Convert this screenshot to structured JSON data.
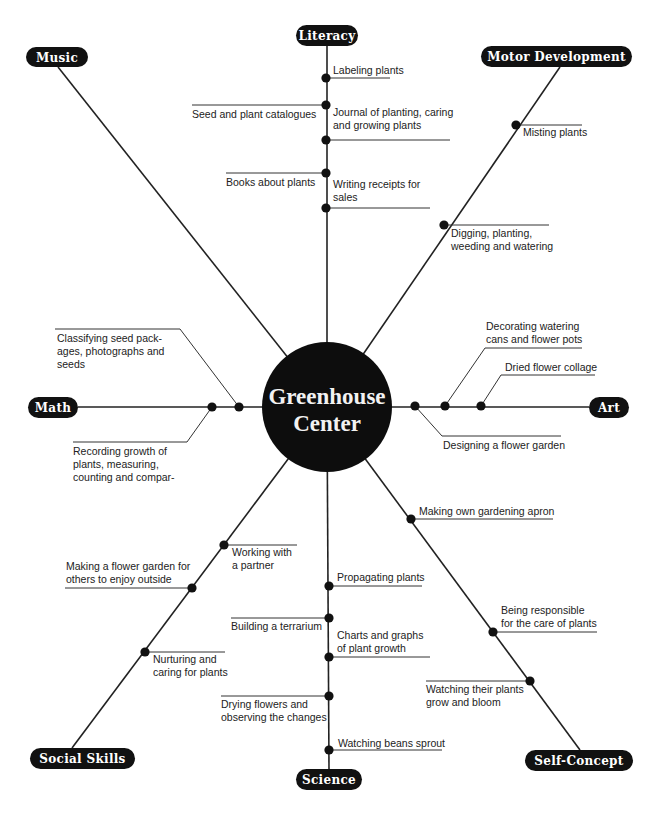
{
  "center": {
    "line1": "Greenhouse",
    "line2": "Center",
    "cx": 327,
    "cy": 407,
    "r": 65
  },
  "colors": {
    "ink": "#111111",
    "label_text": "#ffffff",
    "body_text": "#222222",
    "background": "#ffffff"
  },
  "categories": [
    {
      "id": "literacy",
      "label": "Literacy",
      "pill": {
        "x": 296,
        "y": 25,
        "w": 62,
        "h": 21
      },
      "end": [
        327,
        46
      ],
      "items": [
        {
          "lines": [
            "Labeling plants"
          ],
          "dot": [
            326,
            78
          ],
          "side": "right"
        },
        {
          "lines": [
            "Seed and plant catalogues"
          ],
          "dot": [
            326,
            105
          ],
          "side": "left"
        },
        {
          "lines": [
            "Journal of planting, caring",
            "and growing plants"
          ],
          "dot": [
            326,
            140
          ],
          "side": "right"
        },
        {
          "lines": [
            "Books about plants"
          ],
          "dot": [
            326,
            173
          ],
          "side": "left"
        },
        {
          "lines": [
            "Writing receipts for",
            "sales"
          ],
          "dot": [
            326,
            208
          ],
          "side": "right"
        }
      ]
    },
    {
      "id": "music",
      "label": "Music",
      "pill": {
        "x": 26,
        "y": 47,
        "w": 62,
        "h": 20
      },
      "end": [
        58,
        67
      ],
      "items": []
    },
    {
      "id": "motor",
      "label": "Motor Development",
      "pill": {
        "x": 481,
        "y": 46,
        "w": 151,
        "h": 21
      },
      "end": [
        560,
        67
      ],
      "items": [
        {
          "lines": [
            "Misting plants"
          ],
          "dot": [
            516,
            125
          ],
          "side": "right"
        },
        {
          "lines": [
            "Digging, planting,",
            "weeding and watering"
          ],
          "dot": [
            444,
            225
          ],
          "side": "right"
        }
      ]
    },
    {
      "id": "math",
      "label": "Math",
      "pill": {
        "x": 28,
        "y": 397,
        "w": 50,
        "h": 21
      },
      "end": [
        78,
        407
      ],
      "items": [
        {
          "lines": [
            "Classifying seed pack-",
            "ages, photographs and",
            "seeds"
          ],
          "dot": [
            239,
            407
          ],
          "side": "upper-left"
        },
        {
          "lines": [
            "Recording growth of",
            "plants, measuring,",
            "counting and compar-"
          ],
          "dot": [
            212,
            407
          ],
          "side": "lower-left"
        }
      ]
    },
    {
      "id": "art",
      "label": "Art",
      "pill": {
        "x": 589,
        "y": 397,
        "w": 40,
        "h": 21
      },
      "end": [
        589,
        407
      ],
      "items": [
        {
          "lines": [
            "Decorating watering",
            "cans and flower pots"
          ],
          "dot": [
            445,
            406
          ],
          "side": "upper-right"
        },
        {
          "lines": [
            "Dried flower collage"
          ],
          "dot": [
            481,
            406
          ],
          "side": "upper-right"
        },
        {
          "lines": [
            "Designing a flower garden"
          ],
          "dot": [
            415,
            406
          ],
          "side": "lower-right"
        }
      ]
    },
    {
      "id": "social",
      "label": "Social Skills",
      "pill": {
        "x": 30,
        "y": 748,
        "w": 105,
        "h": 21
      },
      "end": [
        72,
        748
      ],
      "items": [
        {
          "lines": [
            "Working with",
            "a partner"
          ],
          "dot": [
            224,
            545
          ],
          "side": "right"
        },
        {
          "lines": [
            "Making a flower garden for",
            "others to enjoy outside"
          ],
          "dot": [
            192,
            588
          ],
          "side": "left"
        },
        {
          "lines": [
            "Nurturing and",
            "caring for plants"
          ],
          "dot": [
            145,
            652
          ],
          "side": "right"
        }
      ]
    },
    {
      "id": "science",
      "label": "Science",
      "pill": {
        "x": 296,
        "y": 769,
        "w": 66,
        "h": 21
      },
      "end": [
        329,
        769
      ],
      "items": [
        {
          "lines": [
            "Propagating plants"
          ],
          "dot": [
            329,
            586
          ],
          "side": "right"
        },
        {
          "lines": [
            "Building a terrarium"
          ],
          "dot": [
            329,
            618
          ],
          "side": "left"
        },
        {
          "lines": [
            "Charts and graphs",
            "of plant growth"
          ],
          "dot": [
            329,
            657
          ],
          "side": "right"
        },
        {
          "lines": [
            "Drying flowers and",
            "observing the changes"
          ],
          "dot": [
            329,
            696
          ],
          "side": "left"
        },
        {
          "lines": [
            "Watching beans sprout"
          ],
          "dot": [
            329,
            750
          ],
          "side": "right"
        }
      ]
    },
    {
      "id": "self",
      "label": "Self-Concept",
      "pill": {
        "x": 525,
        "y": 750,
        "w": 108,
        "h": 21
      },
      "end": [
        580,
        750
      ],
      "items": [
        {
          "lines": [
            "Making own gardening apron"
          ],
          "dot": [
            411,
            519
          ],
          "side": "right"
        },
        {
          "lines": [
            "Being responsible",
            "for the care of plants"
          ],
          "dot": [
            493,
            632
          ],
          "side": "right"
        },
        {
          "lines": [
            "Watching their plants",
            "grow and bloom"
          ],
          "dot": [
            530,
            681
          ],
          "side": "left"
        }
      ]
    }
  ],
  "layout": {
    "literacy": [
      {
        "line": [
          [
            326,
            78
          ],
          [
            390,
            78
          ]
        ],
        "text": [
          333,
          74
        ]
      },
      {
        "line": [
          [
            192,
            105
          ],
          [
            326,
            105
          ]
        ],
        "text": [
          192,
          118
        ]
      },
      {
        "line": [
          [
            326,
            140
          ],
          [
            450,
            140
          ]
        ],
        "text": [
          333,
          116
        ]
      },
      {
        "line": [
          [
            226,
            173
          ],
          [
            326,
            173
          ]
        ],
        "text": [
          226,
          186
        ]
      },
      {
        "line": [
          [
            326,
            208
          ],
          [
            430,
            208
          ]
        ],
        "text": [
          333,
          188
        ]
      }
    ],
    "motor": [
      {
        "line": [
          [
            516,
            125
          ],
          [
            582,
            125
          ]
        ],
        "text": [
          523,
          136
        ]
      },
      {
        "line": [
          [
            444,
            225
          ],
          [
            549,
            225
          ]
        ],
        "text": [
          451,
          237
        ]
      }
    ],
    "math": [
      {
        "line": [
          [
            239,
            407
          ],
          [
            180,
            329
          ],
          [
            55,
            329
          ]
        ],
        "text": [
          57,
          342
        ]
      },
      {
        "line": [
          [
            212,
            407
          ],
          [
            187,
            442
          ],
          [
            73,
            442
          ]
        ],
        "text": [
          73,
          455
        ]
      }
    ],
    "art": [
      {
        "line": [
          [
            445,
            406
          ],
          [
            485,
            348
          ],
          [
            582,
            348
          ]
        ],
        "text": [
          486,
          330
        ]
      },
      {
        "line": [
          [
            481,
            406
          ],
          [
            501,
            375
          ],
          [
            595,
            375
          ]
        ],
        "text": [
          505,
          371
        ]
      },
      {
        "line": [
          [
            415,
            406
          ],
          [
            442,
            436
          ],
          [
            561,
            436
          ]
        ],
        "text": [
          443,
          449
        ]
      }
    ],
    "social": [
      {
        "line": [
          [
            224,
            545
          ],
          [
            297,
            545
          ]
        ],
        "text": [
          232,
          556
        ]
      },
      {
        "line": [
          [
            65,
            588
          ],
          [
            192,
            588
          ]
        ],
        "text": [
          66,
          570
        ]
      },
      {
        "line": [
          [
            145,
            652
          ],
          [
            225,
            652
          ]
        ],
        "text": [
          153,
          663
        ]
      }
    ],
    "science": [
      {
        "line": [
          [
            329,
            586
          ],
          [
            422,
            586
          ]
        ],
        "text": [
          337,
          581
        ]
      },
      {
        "line": [
          [
            231,
            618
          ],
          [
            329,
            618
          ]
        ],
        "text": [
          231,
          630
        ]
      },
      {
        "line": [
          [
            329,
            657
          ],
          [
            430,
            657
          ]
        ],
        "text": [
          337,
          639
        ]
      },
      {
        "line": [
          [
            221,
            696
          ],
          [
            329,
            696
          ]
        ],
        "text": [
          221,
          708
        ]
      },
      {
        "line": [
          [
            329,
            750
          ],
          [
            442,
            750
          ]
        ],
        "text": [
          338,
          747
        ]
      }
    ],
    "self": [
      {
        "line": [
          [
            411,
            519
          ],
          [
            553,
            519
          ]
        ],
        "text": [
          419,
          515
        ]
      },
      {
        "line": [
          [
            493,
            632
          ],
          [
            597,
            632
          ]
        ],
        "text": [
          501,
          614
        ]
      },
      {
        "line": [
          [
            426,
            681
          ],
          [
            530,
            681
          ]
        ],
        "text": [
          426,
          693
        ]
      }
    ]
  }
}
